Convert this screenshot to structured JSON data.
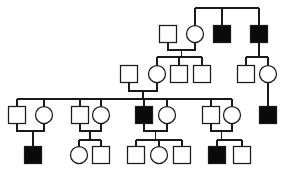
{
  "chart_data": {
    "type": "diagram",
    "title": "",
    "subtitle": "",
    "diagram_kind": "pedigree-chart",
    "legend": [
      {
        "symbol": "square",
        "fill": "unaffected",
        "meaning": "unaffected male"
      },
      {
        "symbol": "circle",
        "fill": "unaffected",
        "meaning": "unaffected female"
      },
      {
        "symbol": "square",
        "fill": "affected",
        "meaning": "affected male"
      },
      {
        "symbol": "circle",
        "fill": "affected",
        "meaning": "affected female"
      }
    ],
    "colors": {
      "affected": "#0a0a0a",
      "unaffected": "#ffffff",
      "stroke": "#1a1a1a",
      "background": "#ffffff"
    },
    "generations": 4,
    "counts": {
      "total_individuals": 28,
      "affected_individuals": 8,
      "males": 19,
      "females": 9
    },
    "individuals": [
      {
        "id": "I-1",
        "generation": 1,
        "sex": "male",
        "affected": false,
        "shape": "square",
        "cx": 168,
        "cy": 34,
        "size": 17
      },
      {
        "id": "I-2",
        "generation": 1,
        "sex": "female",
        "affected": false,
        "shape": "circle",
        "cx": 195,
        "cy": 34,
        "size": 17
      },
      {
        "id": "I-3",
        "generation": 1,
        "sex": "male",
        "affected": true,
        "shape": "square",
        "cx": 222,
        "cy": 34,
        "size": 17
      },
      {
        "id": "I-4",
        "generation": 1,
        "sex": "male",
        "affected": true,
        "shape": "square",
        "cx": 259,
        "cy": 34,
        "size": 17
      },
      {
        "id": "II-1",
        "generation": 2,
        "sex": "male",
        "affected": false,
        "shape": "square",
        "cx": 129,
        "cy": 74,
        "size": 17
      },
      {
        "id": "II-2",
        "generation": 2,
        "sex": "female",
        "affected": false,
        "shape": "circle",
        "cx": 157,
        "cy": 74,
        "size": 17
      },
      {
        "id": "II-3",
        "generation": 2,
        "sex": "male",
        "affected": false,
        "shape": "square",
        "cx": 179,
        "cy": 74,
        "size": 17
      },
      {
        "id": "II-4",
        "generation": 2,
        "sex": "male",
        "affected": false,
        "shape": "square",
        "cx": 202,
        "cy": 74,
        "size": 17
      },
      {
        "id": "II-5",
        "generation": 2,
        "sex": "male",
        "affected": false,
        "shape": "square",
        "cx": 246,
        "cy": 74,
        "size": 17
      },
      {
        "id": "II-6",
        "generation": 2,
        "sex": "female",
        "affected": false,
        "shape": "circle",
        "cx": 268,
        "cy": 74,
        "size": 17
      },
      {
        "id": "III-1",
        "generation": 3,
        "sex": "male",
        "affected": false,
        "shape": "square",
        "cx": 17,
        "cy": 115,
        "size": 17
      },
      {
        "id": "III-2",
        "generation": 3,
        "sex": "female",
        "affected": false,
        "shape": "circle",
        "cx": 44,
        "cy": 115,
        "size": 17
      },
      {
        "id": "III-3",
        "generation": 3,
        "sex": "male",
        "affected": false,
        "shape": "square",
        "cx": 80,
        "cy": 115,
        "size": 17
      },
      {
        "id": "III-4",
        "generation": 3,
        "sex": "female",
        "affected": false,
        "shape": "circle",
        "cx": 101,
        "cy": 115,
        "size": 17
      },
      {
        "id": "III-5",
        "generation": 3,
        "sex": "male",
        "affected": true,
        "shape": "square",
        "cx": 144,
        "cy": 115,
        "size": 17
      },
      {
        "id": "III-6",
        "generation": 3,
        "sex": "female",
        "affected": false,
        "shape": "circle",
        "cx": 167,
        "cy": 115,
        "size": 17
      },
      {
        "id": "III-7",
        "generation": 3,
        "sex": "male",
        "affected": false,
        "shape": "square",
        "cx": 211,
        "cy": 115,
        "size": 17
      },
      {
        "id": "III-8",
        "generation": 3,
        "sex": "female",
        "affected": false,
        "shape": "circle",
        "cx": 232,
        "cy": 115,
        "size": 17
      },
      {
        "id": "III-9",
        "generation": 3,
        "sex": "male",
        "affected": true,
        "shape": "square",
        "cx": 268,
        "cy": 115,
        "size": 17
      },
      {
        "id": "IV-1",
        "generation": 4,
        "sex": "male",
        "affected": true,
        "shape": "square",
        "cx": 33,
        "cy": 155,
        "size": 17
      },
      {
        "id": "IV-2",
        "generation": 4,
        "sex": "female",
        "affected": false,
        "shape": "circle",
        "cx": 79,
        "cy": 155,
        "size": 17
      },
      {
        "id": "IV-3",
        "generation": 4,
        "sex": "male",
        "affected": false,
        "shape": "square",
        "cx": 101,
        "cy": 155,
        "size": 17
      },
      {
        "id": "IV-4",
        "generation": 4,
        "sex": "male",
        "affected": false,
        "shape": "square",
        "cx": 136,
        "cy": 155,
        "size": 17
      },
      {
        "id": "IV-5",
        "generation": 4,
        "sex": "female",
        "affected": false,
        "shape": "circle",
        "cx": 159,
        "cy": 155,
        "size": 17
      },
      {
        "id": "IV-6",
        "generation": 4,
        "sex": "male",
        "affected": false,
        "shape": "square",
        "cx": 182,
        "cy": 155,
        "size": 17
      },
      {
        "id": "IV-7",
        "generation": 4,
        "sex": "male",
        "affected": true,
        "shape": "square",
        "cx": 217,
        "cy": 155,
        "size": 17
      },
      {
        "id": "IV-8",
        "generation": 4,
        "sex": "male",
        "affected": false,
        "shape": "square",
        "cx": 242,
        "cy": 155,
        "size": 17
      }
    ],
    "matings": [
      {
        "partners": [
          "I-1",
          "I-2"
        ],
        "children": [
          "II-2",
          "II-3",
          "II-4"
        ]
      },
      {
        "partners": [
          "I-4"
        ],
        "children": [
          "II-5",
          "II-6"
        ]
      },
      {
        "partners": [
          "II-1",
          "II-2"
        ],
        "children": [
          "III-1",
          "III-2",
          "III-3",
          "III-4",
          "III-5",
          "III-6",
          "III-7",
          "III-8"
        ]
      },
      {
        "partners": [
          "II-6"
        ],
        "children": [
          "III-9"
        ]
      },
      {
        "partners": [
          "III-1",
          "III-2"
        ],
        "children": [
          "IV-1"
        ]
      },
      {
        "partners": [
          "III-3",
          "III-4"
        ],
        "children": [
          "IV-2",
          "IV-3"
        ]
      },
      {
        "partners": [
          "III-5",
          "III-6"
        ],
        "children": [
          "IV-4",
          "IV-5",
          "IV-6"
        ]
      },
      {
        "partners": [
          "III-7",
          "III-8"
        ],
        "children": [
          "IV-7",
          "IV-8"
        ]
      }
    ],
    "sibship_lines": [
      {
        "generation": 1,
        "y": 8,
        "x_start": 195,
        "x_end": 259
      },
      {
        "generation": 2,
        "y": 57,
        "x_start": 157,
        "x_end": 202
      },
      {
        "generation": 2,
        "y": 57,
        "x_start": 246,
        "x_end": 268
      },
      {
        "generation": 3,
        "y": 99,
        "x_start": 17,
        "x_end": 232
      },
      {
        "generation": 4,
        "y": 140,
        "x_start": 79,
        "x_end": 101
      },
      {
        "generation": 4,
        "y": 140,
        "x_start": 136,
        "x_end": 182
      },
      {
        "generation": 4,
        "y": 140,
        "x_start": 217,
        "x_end": 242
      }
    ]
  }
}
